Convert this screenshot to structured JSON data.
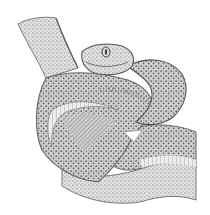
{
  "image": {
    "subject": "Engraving-style illustration of a coiled viper on a branch",
    "alt": "Stippled pen-and-ink drawing of a snake coiled around itself, head raised at top center",
    "palette": {
      "background": "#ffffff",
      "ink_dark": "#4a4a4a",
      "ink_mid": "#8a8a8a",
      "ink_light": "#c4c4c4",
      "paper": "#f4f4f4"
    },
    "elements": [
      {
        "name": "branch-tail",
        "description": "Scaled tail segment rising to top-left"
      },
      {
        "name": "snake-head",
        "description": "Head with eye, facing viewer at top center"
      },
      {
        "name": "upper-right-coil",
        "description": "Body loop arching to the right of the head"
      },
      {
        "name": "large-body-loop",
        "description": "Big looping coil on the left with ventral scales"
      },
      {
        "name": "lower-body",
        "description": "Body segment running across the bottom right"
      },
      {
        "name": "bottom-tail",
        "description": "Curving lower segment along the bottom"
      }
    ]
  }
}
